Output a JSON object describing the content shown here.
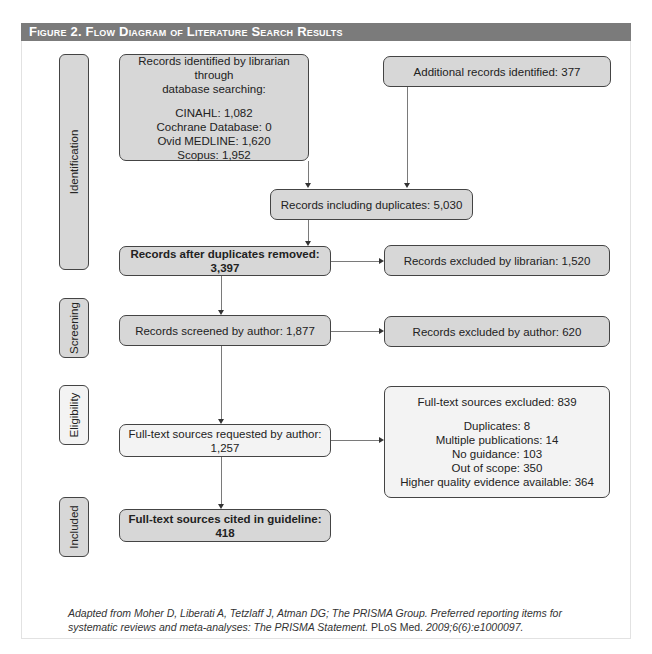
{
  "figure": {
    "title": "Figure 2. Flow Diagram of Literature Search Results"
  },
  "stages": {
    "identification": "Identification",
    "screening": "Screening",
    "eligibility": "Eligibility",
    "included": "Included"
  },
  "boxes": {
    "records_identified": {
      "heading_line1": "Records identified by librarian through",
      "heading_line2": "database searching:",
      "sources": [
        "CINAHL: 1,082",
        "Cochrane Database: 0",
        "Ovid MEDLINE: 1,620",
        "Scopus: 1,952"
      ]
    },
    "additional_records": "Additional records identified: 377",
    "including_duplicates": "Records including duplicates: 5,030",
    "after_duplicates": "Records after duplicates removed: 3,397",
    "excluded_librarian": "Records excluded by librarian: 1,520",
    "screened_author": "Records screened by author: 1,877",
    "excluded_author": "Records excluded by author: 620",
    "fulltext_requested": "Full-text sources requested by author: 1,257",
    "fulltext_excluded": {
      "heading": "Full-text sources excluded: 839",
      "reasons": [
        "Duplicates: 8",
        "Multiple publications: 14",
        "No guidance: 103",
        "Out of scope: 350",
        "Higher quality evidence available: 364"
      ]
    },
    "fulltext_cited": "Full-text sources cited in guideline: 418"
  },
  "caption": {
    "italic_part": "Adapted from Moher D, Liberati A, Tetzlaff J, Atman DG; The PRISMA Group. Preferred reporting items for systematic reviews and meta-analyses: The PRISMA Statement.",
    "upright_part": " PLoS Med.",
    "italic_tail": " 2009;6(6):e1000097."
  },
  "colors": {
    "header_bg": "#7b7b7b",
    "dark_box": "#d7d7d7",
    "light_box": "#f3f3f3",
    "border": "#444444"
  }
}
